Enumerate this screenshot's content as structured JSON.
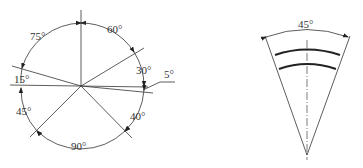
{
  "left_diagram": {
    "labels": {
      "a60": "60°",
      "a75": "75°",
      "a30": "30°",
      "a5": "5°",
      "a15": "15°",
      "a45": "45°",
      "a40": "40°",
      "a90": "90°"
    }
  },
  "right_diagram": {
    "labels": {
      "angle": "45°"
    }
  }
}
